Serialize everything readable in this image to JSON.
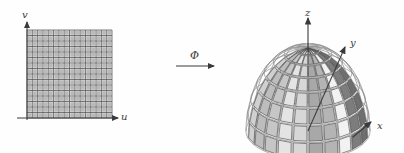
{
  "figure": {
    "background_color": "#fefefe",
    "ink_color": "#3a3a3a",
    "width": 404,
    "height": 153
  },
  "left_panel": {
    "name": "parameter-domain",
    "description": "uv parameter rectangle filled with a square mesh grid",
    "axes": {
      "vertical_label": "v",
      "horizontal_label": "u",
      "origin_px": [
        27,
        118
      ],
      "vertical_arrow_tip_px": [
        27,
        22
      ],
      "horizontal_arrow_tip_px": [
        118,
        118
      ]
    },
    "grid": {
      "x0_px": 27,
      "y0_px": 30,
      "x1_px": 112,
      "y1_px": 118,
      "columns": 16,
      "rows": 16,
      "fill_color": "#b9b9b9",
      "line_color": "#555555",
      "minor_line_color": "#d8d8d8"
    }
  },
  "map_arrow": {
    "name": "mapping-arrow",
    "label": "Φ",
    "label_px": [
      190,
      50
    ],
    "arrow_start_px": [
      176,
      66
    ],
    "arrow_end_px": [
      214,
      66
    ]
  },
  "right_panel": {
    "name": "image-surface",
    "description": "hemispherical dome surface, wireframe with shaded quadrilateral strips on the near side",
    "axes": {
      "z_label": "z",
      "y_label": "y",
      "x_label": "x",
      "z_label_px": [
        305,
        8
      ],
      "y_label_px": [
        350,
        38
      ],
      "x_label_px": [
        377,
        121
      ],
      "apex_px": [
        308,
        48
      ],
      "z_tip_px": [
        308,
        18
      ],
      "y_tip_px": [
        345,
        47
      ],
      "x_tip_px": [
        371,
        122
      ]
    },
    "dome": {
      "center_px": [
        308,
        131
      ],
      "radius_x_px": 62,
      "radius_y_px": 83,
      "tilt_factor": 0.34,
      "longitude_count": 24,
      "latitude_count": 8,
      "wire_color": "#8a8a8a",
      "panel_edge_color": "#4a4a4a"
    },
    "panel_shades": [
      "#6f6f6f",
      "#7d7d7d",
      "#f2f2f2",
      "#b4b4b4",
      "#a8a8a8",
      "#d7d7d7",
      "#e4e4e4",
      "#c6c6c6",
      "#bdbdbd",
      "#d0d0d0"
    ]
  }
}
